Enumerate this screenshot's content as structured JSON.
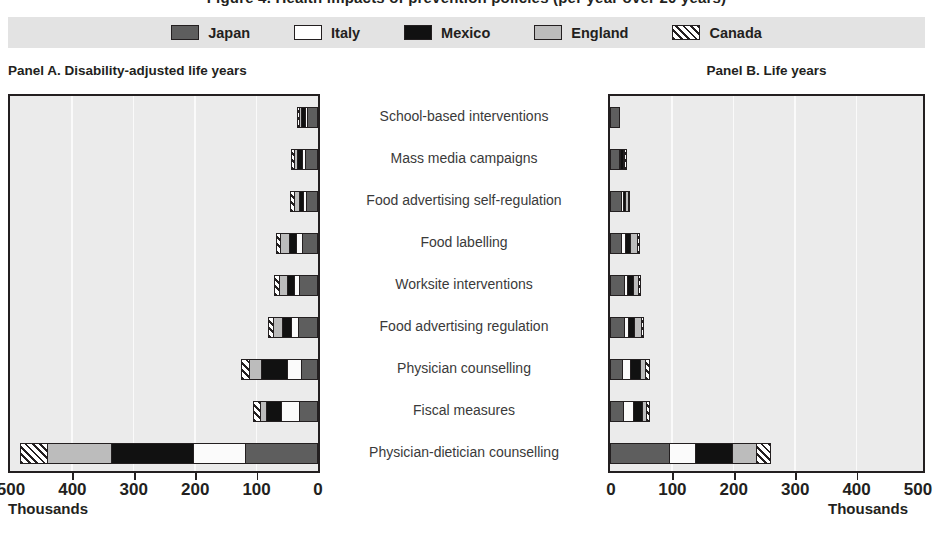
{
  "title_fragment": "Figure 4. Health impacts of prevention policies (per year over 20 years)",
  "legend": {
    "items": [
      {
        "label": "Japan",
        "key": "japan",
        "fill": "#5e5e5e",
        "swatch": "solid-dark-gray"
      },
      {
        "label": "Italy",
        "key": "italy",
        "fill": "#ffffff",
        "swatch": "solid-white"
      },
      {
        "label": "Mexico",
        "key": "mexico",
        "fill": "#111111",
        "swatch": "solid-black"
      },
      {
        "label": "England",
        "key": "england",
        "fill": "#bcbcbc",
        "swatch": "solid-light-gray"
      },
      {
        "label": "Canada",
        "key": "canada",
        "fill": "#ffffff",
        "swatch": "diagonal-hatch"
      }
    ],
    "background": "#e3e3e3"
  },
  "panels": [
    {
      "id": "a",
      "caption": "Panel A. Disability-adjusted life years"
    },
    {
      "id": "b",
      "caption": "Panel B. Life years"
    }
  ],
  "axis": {
    "unit_label": "Thousands",
    "ticks_a": [
      "500",
      "400",
      "300",
      "200",
      "100",
      "0"
    ],
    "ticks_b": [
      "0",
      "100",
      "200",
      "300",
      "400",
      "500"
    ],
    "min": 0,
    "max": 500
  },
  "chart_data": {
    "type": "bar",
    "orientation": "horizontal",
    "stacked": true,
    "title": "Health impacts of prevention policies (per year over 20 years)",
    "unit": "thousands",
    "xlabel": "Thousands",
    "ylabel": "",
    "xlim": [
      0,
      500
    ],
    "grid": true,
    "legend_position": "top",
    "categories": [
      "School-based interventions",
      "Mass media campaigns",
      "Food advertising self-regulation",
      "Food labelling",
      "Worksite interventions",
      "Food advertising regulation",
      "Physician counselling",
      "Fiscal measures",
      "Physician-dietician counselling"
    ],
    "panels": [
      {
        "name": "Panel A. Disability-adjusted life years",
        "direction": "right-to-left",
        "series": [
          {
            "name": "Japan",
            "values": [
              18,
              22,
              20,
              26,
              30,
              33,
              27,
              30,
              118
            ]
          },
          {
            "name": "Italy",
            "values": [
              4,
              5,
              5,
              10,
              9,
              11,
              24,
              31,
              85
            ]
          },
          {
            "name": "Mexico",
            "values": [
              6,
              8,
              7,
              12,
              13,
              15,
              42,
              24,
              135
            ]
          },
          {
            "name": "England",
            "values": [
              5,
              6,
              9,
              16,
              13,
              16,
              21,
              11,
              105
            ]
          },
          {
            "name": "Canada",
            "values": [
              2,
              3,
              4,
              5,
              6,
              6,
              12,
              10,
              43
            ]
          }
        ],
        "totals": [
          35,
          44,
          45,
          69,
          71,
          81,
          126,
          106,
          486
        ]
      },
      {
        "name": "Panel B. Life years",
        "direction": "left-to-right",
        "series": [
          {
            "name": "Japan",
            "values": [
              17,
              14,
              18,
              18,
              22,
              22,
              19,
              21,
              96
            ]
          },
          {
            "name": "Italy",
            "values": [
              0,
              3,
              3,
              7,
              6,
              8,
              14,
              17,
              43
            ]
          },
          {
            "name": "Mexico",
            "values": [
              0,
              5,
              5,
              9,
              10,
              10,
              16,
              15,
              61
            ]
          },
          {
            "name": "England",
            "values": [
              0,
              3,
              5,
              11,
              9,
              12,
              10,
              7,
              39
            ]
          },
          {
            "name": "Canada",
            "values": [
              0,
              2,
              2,
              4,
              4,
              4,
              6,
              5,
              23
            ]
          }
        ],
        "totals": [
          17,
          27,
          33,
          49,
          51,
          56,
          65,
          65,
          262
        ]
      }
    ]
  }
}
